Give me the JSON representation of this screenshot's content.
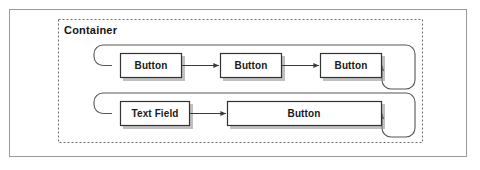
{
  "canvas": {
    "width": 480,
    "height": 170,
    "background": "#ffffff"
  },
  "outer_frame": {
    "name": "outer-frame",
    "x": 9,
    "y": 9,
    "width": 458,
    "height": 148,
    "stroke": "#9a9a9a",
    "fill": "#ffffff"
  },
  "container": {
    "title": "Container",
    "title_x": 64,
    "title_y": 30,
    "x": 58,
    "y": 19,
    "width": 365,
    "height": 124,
    "stroke": "#6e6e6e",
    "dash": "2,2"
  },
  "colors": {
    "node_fill": "#ffffff",
    "node_stroke": "#333333",
    "node_shadow": "#8c8c8c",
    "connector": "#444444",
    "loop_stroke": "#555555",
    "text": "#1a1a1a"
  },
  "rows": [
    {
      "name": "row-top",
      "loop": {
        "x": 94,
        "y": 45,
        "width": 321,
        "height": 44,
        "radius": 9
      },
      "nodes": [
        {
          "label": "Button",
          "x": 120,
          "y": 53,
          "width": 62,
          "height": 25
        },
        {
          "label": "Button",
          "x": 220,
          "y": 53,
          "width": 62,
          "height": 25
        },
        {
          "label": "Button",
          "x": 320,
          "y": 53,
          "width": 62,
          "height": 25
        }
      ],
      "arrows": [
        {
          "from_x": 182,
          "to_x": 220,
          "y": 65.5
        },
        {
          "from_x": 282,
          "to_x": 320,
          "y": 65.5
        }
      ]
    },
    {
      "name": "row-bottom",
      "loop": {
        "x": 94,
        "y": 93,
        "width": 321,
        "height": 44,
        "radius": 9
      },
      "nodes": [
        {
          "label": "Text Field",
          "x": 120,
          "y": 101,
          "width": 70,
          "height": 25
        },
        {
          "label": "Button",
          "x": 227,
          "y": 101,
          "width": 155,
          "height": 25
        }
      ],
      "arrows": [
        {
          "from_x": 190,
          "to_x": 227,
          "y": 113.5
        }
      ]
    }
  ]
}
